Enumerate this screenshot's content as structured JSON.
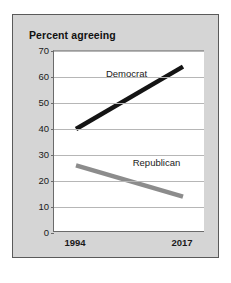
{
  "chart_data": {
    "type": "line",
    "title": "Percent agreeing",
    "xlabel": "",
    "ylabel": "",
    "x": [
      "1994",
      "2017"
    ],
    "xlim": [
      "1994",
      "2017"
    ],
    "ylim": [
      0,
      70
    ],
    "yticks": [
      70,
      60,
      50,
      40,
      30,
      20,
      10,
      0
    ],
    "ytick_labels": [
      "70",
      "60",
      "50",
      "40",
      "30",
      "20",
      "10",
      "0"
    ],
    "xtick_labels": [
      "1994",
      "2017"
    ],
    "grid": "horizontal",
    "legend": "inline-labels",
    "series": [
      {
        "name": "Democrat",
        "label": "Democrat",
        "color": "#141414",
        "values": [
          40,
          64
        ]
      },
      {
        "name": "Republican",
        "label": "Republican",
        "color": "#8c8c8c",
        "values": [
          26,
          14
        ]
      }
    ]
  },
  "panel": {
    "background_color": "#d5d5d5",
    "border_color": "#5a5a5a",
    "plot_background_color": "#ffffff",
    "gridline_color": "#b6b6b6",
    "axis_color": "#6b6b6b"
  }
}
